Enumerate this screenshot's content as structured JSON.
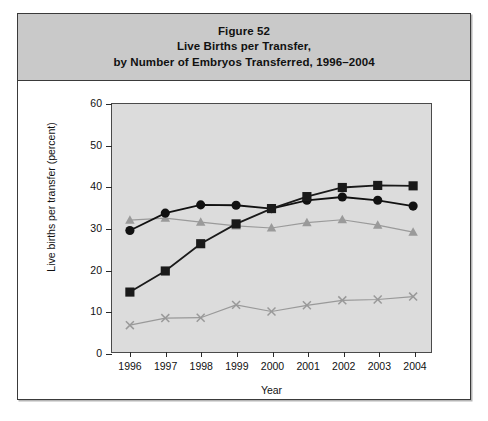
{
  "figure": {
    "title_lines": [
      "Figure 52",
      "Live Births per Transfer,",
      "by Number of Embryos Transferred, 1996–2004"
    ]
  },
  "axes": {
    "ylabel": "Live births per transfer (percent)",
    "xlabel": "Year",
    "ytick_labels": [
      "0",
      "10",
      "20",
      "30",
      "40",
      "50",
      "60"
    ],
    "xtick_labels": [
      "1996",
      "1997",
      "1998",
      "1999",
      "2000",
      "2001",
      "2002",
      "2003",
      "2004"
    ]
  },
  "legend": {
    "title": "Number of embryos transferred:",
    "items": [
      {
        "label": "One",
        "marker": "x-marker",
        "color": "#999999"
      },
      {
        "label": "Two",
        "marker": "square-marker",
        "color": "#1a1a1a"
      },
      {
        "label": "Three",
        "marker": "circle-marker",
        "color": "#111111"
      },
      {
        "label": "Four or more",
        "marker": "triangle-marker",
        "color": "#9a9a9a"
      }
    ]
  },
  "chart_data": {
    "type": "line",
    "xlabel": "Year",
    "ylabel": "Live births per transfer (percent)",
    "categories": [
      "1996",
      "1997",
      "1998",
      "1999",
      "2000",
      "2001",
      "2002",
      "2003",
      "2004"
    ],
    "x": [
      1996,
      1997,
      1998,
      1999,
      2000,
      2001,
      2002,
      2003,
      2004
    ],
    "ylim": [
      0,
      60
    ],
    "yticks": [
      0,
      10,
      20,
      30,
      40,
      50,
      60
    ],
    "grid": false,
    "legend_position": "bottom",
    "plot_background": "#dcdcdc",
    "series": [
      {
        "name": "One",
        "marker": "x",
        "color": "#999999",
        "values": [
          6.5,
          8.2,
          8.3,
          11.4,
          9.8,
          11.3,
          12.5,
          12.7,
          13.4
        ]
      },
      {
        "name": "Two",
        "marker": "square",
        "color": "#1a1a1a",
        "values": [
          14.5,
          19.6,
          26.2,
          31.0,
          34.7,
          37.6,
          39.8,
          40.3,
          40.2
        ]
      },
      {
        "name": "Three",
        "marker": "circle",
        "color": "#111111",
        "values": [
          29.4,
          33.6,
          35.6,
          35.5,
          34.7,
          36.7,
          37.5,
          36.7,
          35.3
        ]
      },
      {
        "name": "Four or more",
        "marker": "triangle",
        "color": "#9a9a9a",
        "values": [
          31.9,
          32.4,
          31.4,
          30.5,
          30.0,
          31.3,
          32.0,
          30.7,
          29.0
        ]
      }
    ]
  }
}
